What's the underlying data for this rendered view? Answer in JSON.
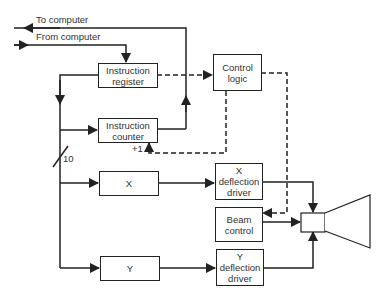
{
  "diagram": {
    "labels": {
      "to_computer": "To computer",
      "from_computer": "From computer",
      "plus_one": "+1",
      "bus_width": "10"
    },
    "blocks": {
      "instruction_register": [
        "Instruction",
        "register"
      ],
      "instruction_counter": [
        "Instruction",
        "counter"
      ],
      "control_logic": [
        "Control",
        "logic"
      ],
      "x_register": [
        "X"
      ],
      "y_register": [
        "Y"
      ],
      "x_deflection_driver": [
        "X",
        "deflection",
        "driver"
      ],
      "beam_control": [
        "Beam",
        "control"
      ],
      "y_deflection_driver": [
        "Y",
        "deflection",
        "driver"
      ]
    },
    "output_device": "CRT",
    "colors": {
      "line": "#222222",
      "text": "#333333",
      "background": "#ffffff"
    }
  }
}
